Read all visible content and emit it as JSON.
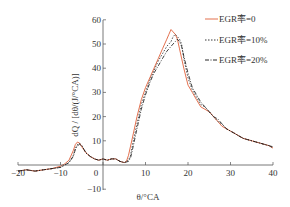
{
  "chart_data": {
    "type": "line",
    "title": "",
    "xlabel": "θ/°CA",
    "ylabel": "dQ / [dθ/(J/°CA)]",
    "xlim": [
      -20,
      40
    ],
    "ylim": [
      -10,
      60
    ],
    "xticks": [
      -20,
      -10,
      0,
      10,
      20,
      30,
      40
    ],
    "yticks": [
      -10,
      0,
      10,
      20,
      30,
      40,
      50,
      60
    ],
    "grid": false,
    "legend_position": "upper right",
    "series": [
      {
        "name": "EGR率=0",
        "style": "solid",
        "color": "#e0603a",
        "x": [
          -20,
          -18,
          -16,
          -14,
          -12,
          -10,
          -9,
          -8,
          -7,
          -6.5,
          -6,
          -5.5,
          -5,
          -4,
          -3,
          -2,
          -1,
          0,
          1,
          2,
          3,
          4,
          5,
          5.5,
          6,
          7,
          8,
          9,
          10,
          11,
          12,
          13,
          14,
          15,
          15.5,
          16,
          16.5,
          17,
          17.5,
          18,
          19,
          20,
          21,
          22,
          23,
          24,
          25,
          26,
          27,
          28,
          29,
          30,
          31,
          32,
          33,
          34,
          35,
          36,
          37,
          38,
          39,
          40
        ],
        "values": [
          -2.5,
          -2,
          -2.5,
          -2,
          -1.5,
          -0.5,
          0.5,
          2,
          6,
          8.5,
          9.5,
          9,
          7.5,
          5,
          3.5,
          2.5,
          2,
          2.5,
          2,
          2.5,
          2.5,
          1.5,
          1,
          1.5,
          4,
          12,
          20,
          27,
          32,
          36,
          40,
          44,
          48,
          52,
          54,
          56,
          55,
          54,
          52,
          48,
          40,
          33,
          30,
          27,
          24,
          23,
          22,
          20,
          18,
          16,
          15,
          14,
          13,
          12,
          11,
          10.5,
          10,
          9.5,
          9,
          8.5,
          8,
          7
        ]
      },
      {
        "name": "EGR率=10%",
        "style": "dotted",
        "color": "#222222",
        "x": [
          -20,
          -18,
          -16,
          -14,
          -12,
          -10,
          -9,
          -8,
          -7,
          -6.5,
          -6,
          -5.5,
          -5,
          -4,
          -3,
          -2,
          -1,
          0,
          1,
          2,
          3,
          4,
          5,
          6,
          6.5,
          7,
          8,
          9,
          10,
          11,
          12,
          13,
          14,
          15,
          16,
          16.5,
          17,
          17.5,
          18,
          18.5,
          19,
          20,
          21,
          22,
          23,
          24,
          25,
          26,
          27,
          28,
          29,
          30,
          31,
          32,
          33,
          34,
          35,
          36,
          37,
          38,
          39,
          40
        ],
        "values": [
          -2.5,
          -2,
          -2.5,
          -2,
          -1.5,
          -1,
          0,
          1,
          4,
          7,
          8.5,
          9,
          8,
          5,
          3.5,
          2.5,
          2,
          2.5,
          2,
          2.5,
          2.5,
          1.5,
          1,
          2,
          4,
          9,
          17,
          25,
          30,
          35,
          39,
          43,
          46,
          49,
          51,
          53,
          54,
          53,
          52,
          50,
          44,
          36,
          31,
          28,
          25,
          24,
          22,
          20,
          18,
          17,
          15,
          14,
          13,
          12,
          11,
          10.5,
          10,
          9.5,
          9,
          8.5,
          8,
          7
        ]
      },
      {
        "name": "EGR率=20%",
        "style": "dashdot",
        "color": "#111111",
        "x": [
          -20,
          -18,
          -16,
          -14,
          -12,
          -10,
          -9,
          -8,
          -7,
          -6.5,
          -6,
          -5.5,
          -5,
          -4,
          -3,
          -2,
          -1,
          0,
          1,
          2,
          3,
          4,
          5,
          6,
          6.5,
          7,
          8,
          9,
          10,
          11,
          12,
          13,
          14,
          15,
          16,
          16.5,
          17,
          17.5,
          18,
          18.5,
          19,
          20,
          21,
          22,
          23,
          24,
          25,
          26,
          27,
          28,
          29,
          30,
          31,
          32,
          33,
          34,
          35,
          36,
          37,
          38,
          39,
          40
        ],
        "values": [
          -2.5,
          -2,
          -2.5,
          -2,
          -1.5,
          -1,
          0,
          1,
          3.5,
          6.5,
          8,
          8.5,
          8,
          5,
          3.5,
          2.5,
          2,
          2.5,
          2,
          2.5,
          2.5,
          1.5,
          1,
          1.5,
          3,
          7,
          15,
          23,
          29,
          34,
          38,
          41,
          44,
          47,
          49,
          50,
          51,
          52,
          51,
          49,
          45,
          38,
          32,
          29,
          26,
          24,
          22,
          20,
          19,
          17,
          15,
          14,
          13,
          12,
          11,
          10.5,
          10,
          9.5,
          9,
          8.5,
          8,
          7.5
        ]
      }
    ]
  },
  "axes": {
    "y_label": "dQ / [dθ/(J/°CA)]",
    "x_label": "θ/°CA",
    "x_tick_labels": [
      "-20",
      "-10",
      "0",
      "10",
      "20",
      "30",
      "40"
    ],
    "y_tick_labels": [
      "60",
      "50",
      "40",
      "30",
      "20",
      "10",
      "0",
      "-10"
    ]
  },
  "legend": {
    "items": [
      {
        "label": "EGR率=0",
        "style": "solid",
        "color": "#e0603a"
      },
      {
        "label": "EGR率=10%",
        "style": "dotted",
        "color": "#222222"
      },
      {
        "label": "EGR率=20%",
        "style": "dashdot",
        "color": "#111111"
      }
    ]
  }
}
